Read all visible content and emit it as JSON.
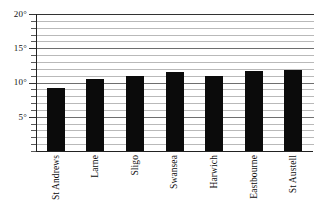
{
  "chart_data": {
    "type": "bar",
    "title": "",
    "subtitle": "",
    "xlabel": "",
    "ylabel": "",
    "categories": [
      "St Andrews",
      "Larne",
      "Sligo",
      "Swansea",
      "Harwich",
      "Eastbourne",
      "St Austell"
    ],
    "values": [
      9.2,
      10.5,
      11.0,
      11.5,
      10.9,
      11.7,
      11.8
    ],
    "ylim": [
      0,
      20
    ],
    "y_major_ticks": [
      5,
      10,
      15,
      20
    ],
    "y_tick_labels": [
      "5°",
      "10°",
      "15°",
      "20°"
    ],
    "y_minor_tick_step": 1,
    "grid": true,
    "grid_orientation": "horizontal",
    "legend": "none",
    "bar_color": "#0b0b0b",
    "gridline_color": "#b9b9b9",
    "major_gridline_color": "#6e6e6e",
    "axis_color": "#222222",
    "x_label_rotation": -90
  },
  "axis": {
    "y_labels": [
      {
        "value": 20,
        "text": "20°"
      },
      {
        "value": 15,
        "text": "15°"
      },
      {
        "value": 10,
        "text": "10°"
      },
      {
        "value": 5,
        "text": "5°"
      }
    ],
    "x_labels": [
      {
        "text": "St Andrews"
      },
      {
        "text": "Larne"
      },
      {
        "text": "Sligo"
      },
      {
        "text": "Swansea"
      },
      {
        "text": "Harwich"
      },
      {
        "text": "Eastbourne"
      },
      {
        "text": "St Austell"
      }
    ]
  }
}
